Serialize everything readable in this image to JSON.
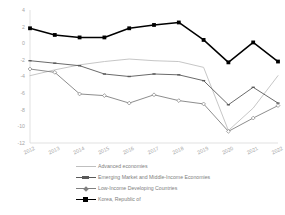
{
  "chart_data": {
    "type": "line",
    "title": "",
    "subtitle": "",
    "xlabel": "",
    "ylabel": "",
    "grid": false,
    "legend_position": "bottom",
    "categories": [
      "2012",
      "2013",
      "2014",
      "2015",
      "2016",
      "2017",
      "2018",
      "2019",
      "2020",
      "2021",
      "2022"
    ],
    "x": [
      2012,
      2013,
      2014,
      2015,
      2016,
      2017,
      2018,
      2019,
      2020,
      2021,
      2022
    ],
    "xlim": [
      2012,
      2022
    ],
    "ylim": [
      -12,
      4
    ],
    "yticks": [
      4,
      2,
      0,
      -2,
      -4,
      -6,
      -8,
      -10,
      -12
    ],
    "ytick_labels": [
      "4",
      "2",
      "0",
      "-2",
      "-4",
      "-6",
      "-8",
      "-10",
      "-12"
    ],
    "series": [
      {
        "name": "Advanced economies",
        "marker": "none",
        "color": "#bfbfbf",
        "values": [
          -3.9,
          -3.2,
          -2.6,
          -2.2,
          -1.9,
          -2.1,
          -2.2,
          -2.9,
          -10.5,
          -7.8,
          -3.9
        ]
      },
      {
        "name": "Emerging Market and Middle-Income Economies",
        "marker": "dash",
        "color": "#595959",
        "values": [
          -2.1,
          -2.4,
          -2.7,
          -3.7,
          -4.0,
          -3.7,
          -3.8,
          -4.5,
          -7.4,
          -5.3,
          -7.2
        ]
      },
      {
        "name": "Low-Income Developing Countries",
        "marker": "diamond",
        "color": "#808080",
        "values": [
          -3.1,
          -3.5,
          -6.1,
          -6.3,
          -7.2,
          -6.2,
          -6.9,
          -7.3,
          -10.6,
          -9.0,
          -7.5
        ]
      },
      {
        "name": "Korea, Republic of",
        "marker": "square",
        "color": "#000000",
        "values": [
          1.8,
          1.0,
          0.7,
          0.7,
          1.8,
          2.2,
          2.5,
          0.4,
          -2.3,
          0.1,
          -2.2
        ]
      }
    ]
  },
  "legend": {
    "items": [
      {
        "label": "Advanced economies"
      },
      {
        "label": "Emerging Market and Middle-Income Economies"
      },
      {
        "label": "Low-Income Developing Countries"
      },
      {
        "label": "Korea, Republic of"
      }
    ]
  }
}
